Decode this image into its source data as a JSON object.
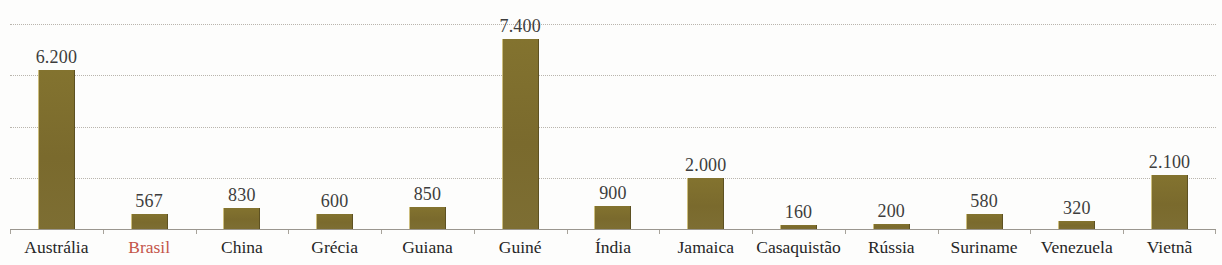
{
  "chart_data": {
    "type": "bar",
    "title": "",
    "subtitle": "",
    "xlabel": "",
    "ylabel": "",
    "ylim": [
      0,
      8000
    ],
    "grid": true,
    "gridline_values": [
      8000,
      6000,
      4000,
      2000
    ],
    "legend": "none",
    "value_label_format": "pt-BR thousands separator (.)",
    "categories": [
      "Austrália",
      "Brasil",
      "China",
      "Grécia",
      "Guiana",
      "Guiné",
      "Índia",
      "Jamaica",
      "Casaquistão",
      "Rússia",
      "Suriname",
      "Venezuela",
      "Vietnã"
    ],
    "values": [
      6200,
      567,
      830,
      600,
      850,
      7400,
      900,
      2000,
      160,
      200,
      580,
      320,
      2100
    ],
    "value_labels": [
      "6.200",
      "567",
      "830",
      "600",
      "850",
      "7.400",
      "900",
      "2.000",
      "160",
      "200",
      "580",
      "320",
      "2.100"
    ],
    "highlight_category": "Brasil",
    "colors": {
      "bar": "#7d6d2f",
      "bar_highlight_text": "#c4554a",
      "value_text": "#3d3d3d",
      "category_text": "#262626",
      "gridline": "#b9b5ad",
      "axis": "#9a968e",
      "background": "#fdfdfc"
    }
  },
  "bars": [
    {
      "label": "Austrália",
      "value_label": "6.200",
      "highlight": false
    },
    {
      "label": "Brasil",
      "value_label": "567",
      "highlight": true
    },
    {
      "label": "China",
      "value_label": "830",
      "highlight": false
    },
    {
      "label": "Grécia",
      "value_label": "600",
      "highlight": false
    },
    {
      "label": "Guiana",
      "value_label": "850",
      "highlight": false
    },
    {
      "label": "Guiné",
      "value_label": "7.400",
      "highlight": false
    },
    {
      "label": "Índia",
      "value_label": "900",
      "highlight": false
    },
    {
      "label": "Jamaica",
      "value_label": "2.000",
      "highlight": false
    },
    {
      "label": "Casaquistão",
      "value_label": "160",
      "highlight": false
    },
    {
      "label": "Rússia",
      "value_label": "200",
      "highlight": false
    },
    {
      "label": "Suriname",
      "value_label": "580",
      "highlight": false
    },
    {
      "label": "Venezuela",
      "value_label": "320",
      "highlight": false
    },
    {
      "label": "Vietnã",
      "value_label": "2.100",
      "highlight": false
    }
  ]
}
